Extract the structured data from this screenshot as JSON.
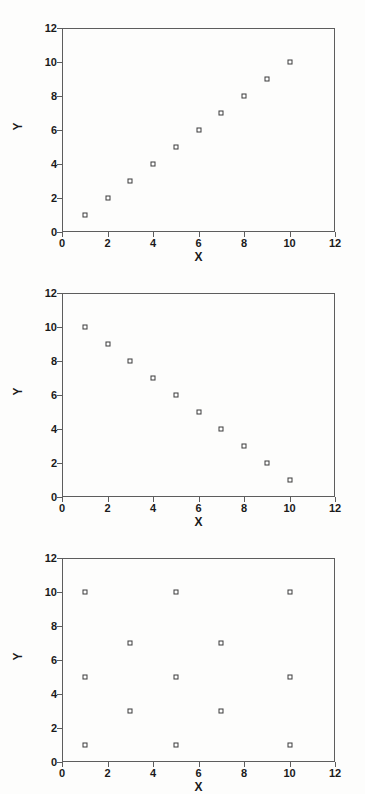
{
  "figure": {
    "background_color": "#fdfdfc",
    "axis_color": "#5d5d5d",
    "marker_color": "#3a3a3a",
    "panel_count": 3
  },
  "chart_data": [
    {
      "type": "scatter",
      "title": "",
      "xlabel": "X",
      "ylabel": "Y",
      "xlim": [
        0,
        12
      ],
      "ylim": [
        0,
        12
      ],
      "xticks": [
        0,
        2,
        4,
        6,
        8,
        10,
        12
      ],
      "yticks": [
        0,
        2,
        4,
        6,
        8,
        10,
        12
      ],
      "xticklabels": [
        "0",
        "2",
        "4",
        "6",
        "8",
        "10",
        "12"
      ],
      "yticklabels": [
        "0",
        "2",
        "4",
        "6",
        "8",
        "10",
        "12"
      ],
      "grid": false,
      "legend": null,
      "marker": "open-square",
      "x": [
        1,
        2,
        3,
        4,
        5,
        6,
        7,
        8,
        9,
        10
      ],
      "y": [
        1,
        2,
        3,
        4,
        5,
        6,
        7,
        8,
        9,
        10
      ],
      "points": [
        [
          1,
          1
        ],
        [
          2,
          2
        ],
        [
          3,
          3
        ],
        [
          4,
          4
        ],
        [
          5,
          5
        ],
        [
          6,
          6
        ],
        [
          7,
          7
        ],
        [
          8,
          8
        ],
        [
          9,
          9
        ],
        [
          10,
          10
        ]
      ]
    },
    {
      "type": "scatter",
      "title": "",
      "xlabel": "X",
      "ylabel": "Y",
      "xlim": [
        0,
        12
      ],
      "ylim": [
        0,
        12
      ],
      "xticks": [
        0,
        2,
        4,
        6,
        8,
        10,
        12
      ],
      "yticks": [
        0,
        2,
        4,
        6,
        8,
        10,
        12
      ],
      "xticklabels": [
        "0",
        "2",
        "4",
        "6",
        "8",
        "10",
        "12"
      ],
      "yticklabels": [
        "0",
        "2",
        "4",
        "6",
        "8",
        "10",
        "12"
      ],
      "grid": false,
      "legend": null,
      "marker": "open-square",
      "x": [
        1,
        2,
        3,
        4,
        5,
        6,
        7,
        8,
        9,
        10
      ],
      "y": [
        10,
        9,
        8,
        7,
        6,
        5,
        4,
        3,
        2,
        1
      ],
      "points": [
        [
          1,
          10
        ],
        [
          2,
          9
        ],
        [
          3,
          8
        ],
        [
          4,
          7
        ],
        [
          5,
          6
        ],
        [
          6,
          5
        ],
        [
          7,
          4
        ],
        [
          8,
          3
        ],
        [
          9,
          2
        ],
        [
          10,
          1
        ]
      ]
    },
    {
      "type": "scatter",
      "title": "",
      "xlabel": "X",
      "ylabel": "Y",
      "xlim": [
        0,
        12
      ],
      "ylim": [
        0,
        12
      ],
      "xticks": [
        0,
        2,
        4,
        6,
        8,
        10,
        12
      ],
      "yticks": [
        0,
        2,
        4,
        6,
        8,
        10,
        12
      ],
      "xticklabels": [
        "0",
        "2",
        "4",
        "6",
        "8",
        "10",
        "12"
      ],
      "yticklabels": [
        "0",
        "2",
        "4",
        "6",
        "8",
        "10",
        "12"
      ],
      "grid": false,
      "legend": null,
      "marker": "open-square",
      "x": [
        1,
        1,
        1,
        3,
        3,
        5,
        5,
        5,
        7,
        7,
        10,
        10,
        10
      ],
      "y": [
        10,
        5,
        1,
        7,
        3,
        10,
        5,
        1,
        7,
        3,
        10,
        5,
        1
      ],
      "points": [
        [
          1,
          10
        ],
        [
          1,
          5
        ],
        [
          1,
          1
        ],
        [
          3,
          7
        ],
        [
          3,
          3
        ],
        [
          5,
          10
        ],
        [
          5,
          5
        ],
        [
          5,
          1
        ],
        [
          7,
          7
        ],
        [
          7,
          3
        ],
        [
          10,
          10
        ],
        [
          10,
          5
        ],
        [
          10,
          1
        ]
      ]
    }
  ]
}
